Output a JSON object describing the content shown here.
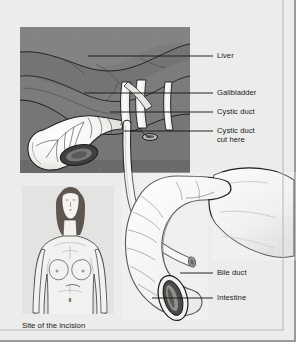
{
  "figure": {
    "caption": "Site of the incision",
    "background_color": "#ebeceb",
    "border_color": "#9a9a9a",
    "ink_color": "#1a1a1a"
  },
  "labels": [
    {
      "id": "liver",
      "text": "Liver",
      "x": 217,
      "y": 51,
      "leader": {
        "x1": 88,
        "y1": 56,
        "x2": 213,
        "y2": 56
      }
    },
    {
      "id": "gallbladder",
      "text": "Gallbladder",
      "x": 217,
      "y": 88,
      "leader": {
        "x1": 84,
        "y1": 93,
        "x2": 213,
        "y2": 93
      }
    },
    {
      "id": "cystic-duct",
      "text": "Cystic duct",
      "x": 217,
      "y": 107,
      "leader": {
        "x1": 110,
        "y1": 112,
        "x2": 213,
        "y2": 112
      }
    },
    {
      "id": "cystic-duct-cut",
      "text": "Cystic duct\ncut here",
      "x": 217,
      "y": 126,
      "leader": {
        "x1": 124,
        "y1": 131,
        "x2": 213,
        "y2": 131
      }
    },
    {
      "id": "bile-duct",
      "text": "Bile duct",
      "x": 217,
      "y": 268,
      "leader": {
        "x1": 180,
        "y1": 273,
        "x2": 213,
        "y2": 273
      }
    },
    {
      "id": "intestine",
      "text": "Intestine",
      "x": 217,
      "y": 293,
      "leader": {
        "x1": 152,
        "y1": 298,
        "x2": 213,
        "y2": 298
      }
    }
  ],
  "structures": {
    "liver": {
      "name": "Liver",
      "fill": "#7c7c7c"
    },
    "gallbladder": {
      "name": "Gallbladder",
      "fill": "#f2f2f0"
    },
    "ducts": {
      "name": "Bile ducts",
      "fill": "#f4f4f2"
    },
    "duodenum": {
      "name": "Intestine (duodenum)",
      "fill": "#f0f0ee"
    },
    "pancreas": {
      "name": "Pancreas",
      "fill": "#efefed"
    }
  },
  "body_figure": {
    "name": "Female torso showing incision site",
    "hair_color": "#5e5650",
    "skin_color": "#f3f2f0",
    "panel_fill": "#e2e2e0"
  }
}
